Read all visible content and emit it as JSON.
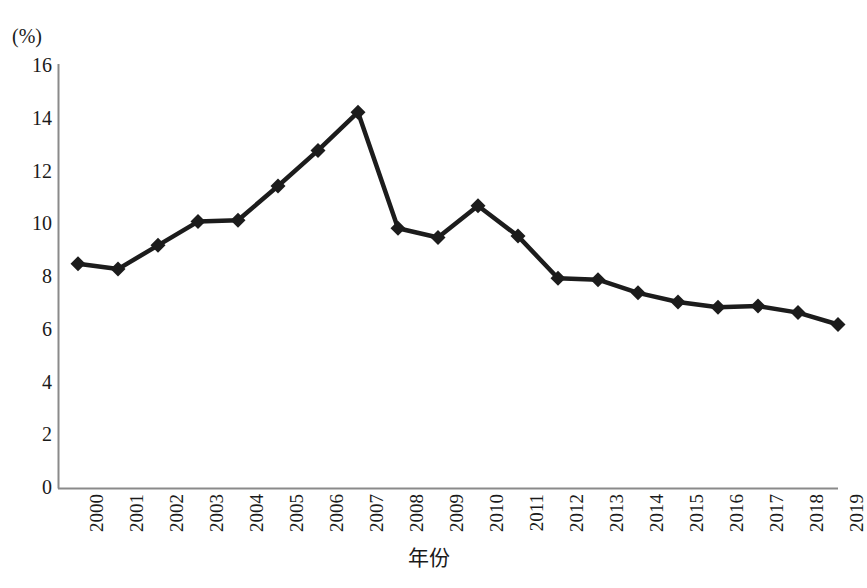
{
  "chart_data": {
    "type": "line",
    "title": "",
    "subtitle": "",
    "xlabel": "年份",
    "ylabel": "(%)",
    "unit_label": "(%)",
    "categories": [
      "2000",
      "2001",
      "2002",
      "2003",
      "2004",
      "2005",
      "2006",
      "2007",
      "2008",
      "2009",
      "2010",
      "2011",
      "2012",
      "2013",
      "2014",
      "2015",
      "2016",
      "2017",
      "2018",
      "2019"
    ],
    "values": [
      8.5,
      8.3,
      9.2,
      10.1,
      10.15,
      11.45,
      12.8,
      14.25,
      9.85,
      9.5,
      10.7,
      9.55,
      7.95,
      7.9,
      7.4,
      7.05,
      6.85,
      6.9,
      6.65,
      6.2
    ],
    "series": [
      {
        "name": "",
        "values": [
          8.5,
          8.3,
          9.2,
          10.1,
          10.15,
          11.45,
          12.8,
          14.25,
          9.85,
          9.5,
          10.7,
          9.55,
          7.95,
          7.9,
          7.4,
          7.05,
          6.85,
          6.9,
          6.65,
          6.2
        ]
      }
    ],
    "ylim": [
      0,
      16
    ],
    "yticks": [
      0,
      2,
      4,
      6,
      8,
      10,
      12,
      14,
      16
    ],
    "ytick_labels": [
      "0",
      "2",
      "4",
      "6",
      "8",
      "10",
      "12",
      "14",
      "16"
    ],
    "xtick_labels": [
      "2000",
      "2001",
      "2002",
      "2003",
      "2004",
      "2005",
      "2006",
      "2007",
      "2008",
      "2009",
      "2010",
      "2011",
      "2012",
      "2013",
      "2014",
      "2015",
      "2016",
      "2017",
      "2018",
      "2019"
    ],
    "xtick_rotation": 90,
    "grid": false,
    "legend": false,
    "legend_position": "none",
    "marker": "diamond",
    "line_color": "#1c1c1c",
    "marker_color": "#1c1c1c",
    "axis_color": "#7a7a7a",
    "background_color": "#ffffff",
    "spines": {
      "left": true,
      "bottom": true,
      "top": false,
      "right": false
    }
  }
}
